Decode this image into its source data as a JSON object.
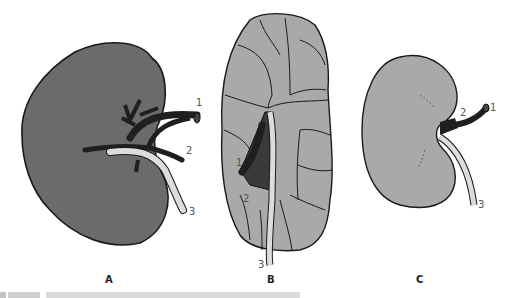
{
  "figure": {
    "panels": [
      {
        "id": "A",
        "label": "A",
        "description": "Kidney with vessels (dark)",
        "callouts": [
          "1",
          "2",
          "3"
        ]
      },
      {
        "id": "B",
        "label": "B",
        "description": "Lobulated kidney",
        "callouts": [
          "1",
          "2",
          "3"
        ]
      },
      {
        "id": "C",
        "label": "C",
        "description": "Bean-shaped kidney",
        "callouts": [
          "1",
          "2",
          "3"
        ]
      }
    ],
    "colors": {
      "kidney_dark": "#6b6b6b",
      "kidney_light": "#a9a9a9",
      "vessel": "#1f1f1f",
      "ureter": "#dcdcdc",
      "outline": "#1a1a1a"
    }
  }
}
